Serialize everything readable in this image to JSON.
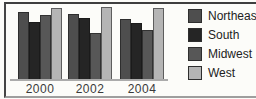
{
  "chart_data": {
    "type": "bar",
    "title": "",
    "xlabel": "",
    "ylabel": "",
    "categories": [
      "2000",
      "2002",
      "2004"
    ],
    "series": [
      {
        "name": "Northeast",
        "color": "#4e4e4e",
        "values": [
          93,
          90,
          83
        ]
      },
      {
        "name": "South",
        "color": "#252525",
        "values": [
          79,
          85,
          78
        ]
      },
      {
        "name": "Midwest",
        "color": "#575757",
        "values": [
          89,
          64,
          68
        ]
      },
      {
        "name": "West",
        "color": "#b5b5b5",
        "values": [
          99,
          100,
          99
        ]
      }
    ],
    "ylim": [
      0,
      100
    ],
    "value_unit": "percent of tallest bar (no y-axis labels visible)",
    "grid": false,
    "legend_position": "right"
  },
  "colors": {
    "background": "#fcfcf9",
    "frame_dark": "#3f3f3f",
    "frame_light": "#9e9e9e",
    "axis_line": "#ababab",
    "tick_text": "#3a3a3a",
    "legend_text": "#222222"
  }
}
